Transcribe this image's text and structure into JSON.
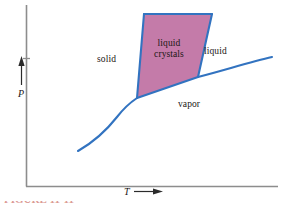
{
  "figure": {
    "kind": "phase-diagram",
    "caption_partial": "FIGURE 11-11"
  },
  "axes": {
    "x_label": "T",
    "y_label": "P",
    "x_arrow": "arrow-right",
    "y_arrow": "arrow-up",
    "axis_color": "#8d8d8d",
    "frame": {
      "x0": 26,
      "y0": 186,
      "x1": 278,
      "y1": 5
    }
  },
  "regions": [
    {
      "id": "solid",
      "label": "solid"
    },
    {
      "id": "liquid-crystals",
      "label": "liquid\ncrystals",
      "line1": "liquid",
      "line2": "crystals",
      "fill": "#c47ba9"
    },
    {
      "id": "liquid",
      "label": "liquid"
    },
    {
      "id": "vapor",
      "label": "vapor"
    }
  ],
  "curves": {
    "color": "#3273c0",
    "sublimation": "M 78 151 C 92 143 106 131 117 117 C 124 108 131 102 137 98",
    "fusion": "M 137 98 L 144 14",
    "lc_liquid_boundary": "M 198 77 L 212 14",
    "lc_top": "M 144 14 L 212 14",
    "vaporization": "M 137 98 L 198 77 C 222 71 250 62 272 57"
  },
  "chart_data": {
    "type": "line",
    "title": "",
    "xlabel": "T",
    "ylabel": "P",
    "grid": false,
    "legend": null,
    "annotations": [
      "solid",
      "liquid crystals",
      "liquid",
      "vapor"
    ],
    "series": [
      {
        "name": "sublimation curve (solid-vapor)",
        "x": [
          78,
          92,
          106,
          117,
          127,
          137
        ],
        "y": [
          151,
          143,
          131,
          117,
          106,
          98
        ]
      },
      {
        "name": "fusion curve (solid-liquid crystals)",
        "x": [
          137,
          144
        ],
        "y": [
          98,
          14
        ]
      },
      {
        "name": "liquid crystals-liquid boundary",
        "x": [
          198,
          212
        ],
        "y": [
          77,
          14
        ]
      },
      {
        "name": "vaporization curve (liquid crystals/liquid-vapor)",
        "x": [
          137,
          198,
          225,
          250,
          272
        ],
        "y": [
          98,
          77,
          70,
          63,
          57
        ]
      }
    ],
    "triple_point": {
      "x": 137,
      "y": 98
    }
  }
}
